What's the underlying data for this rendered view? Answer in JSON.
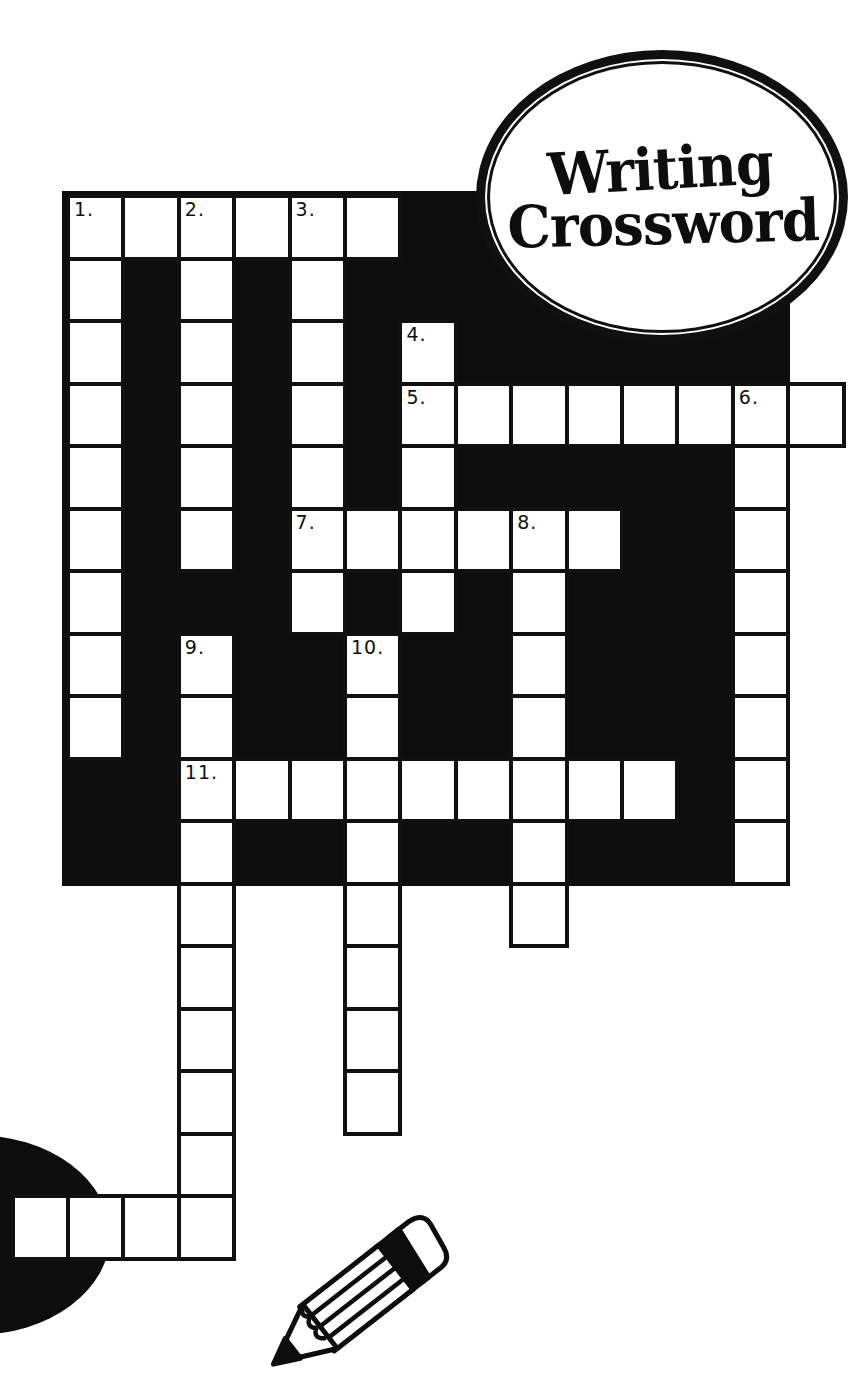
{
  "page": {
    "width": 868,
    "height": 1395,
    "background": "#ffffff",
    "ink": "#0d0d0d"
  },
  "logo": {
    "line1": "Writing",
    "line2": "Crossword"
  },
  "board": {
    "x": 62,
    "y": 191,
    "w": 728,
    "h": 695
  },
  "grid": {
    "origin_x": 68,
    "origin_y": 196,
    "cell_w": 55.4,
    "cell_h": 62.5,
    "border_px": 4,
    "cells": [
      {
        "r": 0,
        "c": 0,
        "n": "1."
      },
      {
        "r": 0,
        "c": 1
      },
      {
        "r": 0,
        "c": 2,
        "n": "2."
      },
      {
        "r": 0,
        "c": 3
      },
      {
        "r": 0,
        "c": 4,
        "n": "3."
      },
      {
        "r": 0,
        "c": 5
      },
      {
        "r": 1,
        "c": 0
      },
      {
        "r": 1,
        "c": 2
      },
      {
        "r": 1,
        "c": 4
      },
      {
        "r": 2,
        "c": 0
      },
      {
        "r": 2,
        "c": 2
      },
      {
        "r": 2,
        "c": 4
      },
      {
        "r": 2,
        "c": 6,
        "n": "4."
      },
      {
        "r": 3,
        "c": 0
      },
      {
        "r": 3,
        "c": 2
      },
      {
        "r": 3,
        "c": 4
      },
      {
        "r": 3,
        "c": 6,
        "n": "5."
      },
      {
        "r": 3,
        "c": 7
      },
      {
        "r": 3,
        "c": 8
      },
      {
        "r": 3,
        "c": 9
      },
      {
        "r": 3,
        "c": 10
      },
      {
        "r": 3,
        "c": 11
      },
      {
        "r": 3,
        "c": 12,
        "n": "6."
      },
      {
        "r": 3,
        "c": 13
      },
      {
        "r": 4,
        "c": 0
      },
      {
        "r": 4,
        "c": 2
      },
      {
        "r": 4,
        "c": 4
      },
      {
        "r": 4,
        "c": 6
      },
      {
        "r": 4,
        "c": 12
      },
      {
        "r": 5,
        "c": 0
      },
      {
        "r": 5,
        "c": 2
      },
      {
        "r": 5,
        "c": 4,
        "n": "7."
      },
      {
        "r": 5,
        "c": 5
      },
      {
        "r": 5,
        "c": 6
      },
      {
        "r": 5,
        "c": 7
      },
      {
        "r": 5,
        "c": 8,
        "n": "8."
      },
      {
        "r": 5,
        "c": 9
      },
      {
        "r": 5,
        "c": 12
      },
      {
        "r": 6,
        "c": 0
      },
      {
        "r": 6,
        "c": 4
      },
      {
        "r": 6,
        "c": 6
      },
      {
        "r": 6,
        "c": 8
      },
      {
        "r": 6,
        "c": 12
      },
      {
        "r": 7,
        "c": 0
      },
      {
        "r": 7,
        "c": 2,
        "n": "9."
      },
      {
        "r": 7,
        "c": 5,
        "n": "10."
      },
      {
        "r": 7,
        "c": 8
      },
      {
        "r": 7,
        "c": 12
      },
      {
        "r": 8,
        "c": 0
      },
      {
        "r": 8,
        "c": 2
      },
      {
        "r": 8,
        "c": 5
      },
      {
        "r": 8,
        "c": 8
      },
      {
        "r": 8,
        "c": 12
      },
      {
        "r": 9,
        "c": 2,
        "n": "11."
      },
      {
        "r": 9,
        "c": 3
      },
      {
        "r": 9,
        "c": 4
      },
      {
        "r": 9,
        "c": 5
      },
      {
        "r": 9,
        "c": 6
      },
      {
        "r": 9,
        "c": 7
      },
      {
        "r": 9,
        "c": 8
      },
      {
        "r": 9,
        "c": 9
      },
      {
        "r": 9,
        "c": 10
      },
      {
        "r": 9,
        "c": 12
      },
      {
        "r": 10,
        "c": 2
      },
      {
        "r": 10,
        "c": 5
      },
      {
        "r": 10,
        "c": 8
      },
      {
        "r": 10,
        "c": 12
      },
      {
        "r": 11,
        "c": 2
      },
      {
        "r": 11,
        "c": 5
      },
      {
        "r": 11,
        "c": 8
      },
      {
        "r": 12,
        "c": 2
      },
      {
        "r": 12,
        "c": 5
      },
      {
        "r": 13,
        "c": 2
      },
      {
        "r": 13,
        "c": 5
      },
      {
        "r": 14,
        "c": 2
      },
      {
        "r": 14,
        "c": 5
      },
      {
        "r": 15,
        "c": 2
      },
      {
        "r": 16,
        "c": -1
      },
      {
        "r": 16,
        "c": 0
      },
      {
        "r": 16,
        "c": 1
      },
      {
        "r": 16,
        "c": 2
      }
    ]
  },
  "decor": {
    "blob": {
      "cx": -25,
      "cy": 1235,
      "rx": 135,
      "ry": 100
    },
    "pencil": {
      "x": 256,
      "y": 1206,
      "angle_deg": -38
    }
  }
}
